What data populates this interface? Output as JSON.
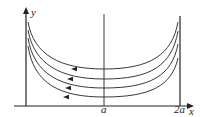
{
  "diagram": {
    "axes": {
      "x_label": "x",
      "y_label": "y",
      "tick_labels": [
        "a",
        "2a"
      ]
    },
    "curves": [
      {
        "id": 1,
        "path": "M28,22 C34,55 60,69 104,69 C150,69 172,55 178,22"
      },
      {
        "id": 2,
        "path": "M28,30 C34,64 60,79 104,79 C150,79 172,66 178,31"
      },
      {
        "id": 3,
        "path": "M28,38 C34,74 60,88 104,88 C150,88 172,76 178,44"
      },
      {
        "id": 4,
        "path": "M28,46 C34,84 60,97 104,97 C150,97 172,86 178,58"
      }
    ],
    "arrows": [
      {
        "x": 74,
        "y": 69
      },
      {
        "x": 70,
        "y": 79
      },
      {
        "x": 68,
        "y": 88
      },
      {
        "x": 66,
        "y": 97
      }
    ],
    "colors": {
      "stroke": "#222222",
      "background": "#ffffff"
    }
  }
}
